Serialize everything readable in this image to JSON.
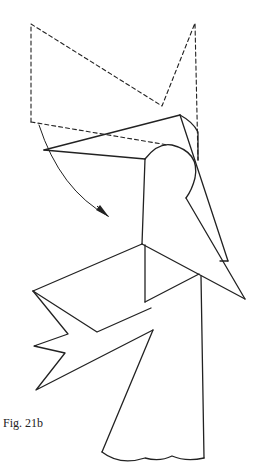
{
  "figure": {
    "caption": "Fig. 21b",
    "line_color": "#222222",
    "background": "#ffffff",
    "elements": [
      {
        "name": "dashed-previous-position",
        "style": "dashed"
      },
      {
        "name": "folded-flap",
        "style": "solid"
      },
      {
        "name": "fold-arrow",
        "style": "curved-arrow"
      },
      {
        "name": "body-front",
        "style": "solid"
      },
      {
        "name": "left-wing",
        "style": "solid"
      },
      {
        "name": "skirt",
        "style": "solid"
      }
    ]
  }
}
